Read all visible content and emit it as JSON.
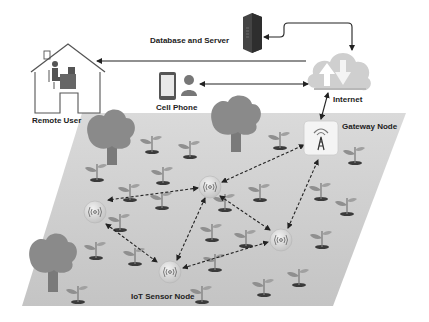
{
  "labels": {
    "database_server": "Database and Server",
    "remote_user": "Remote User",
    "cell_phone": "Cell Phone",
    "internet": "Internet",
    "gateway_node": "Gateway Node",
    "iot_sensor_node": "IoT Sensor Node"
  },
  "colors": {
    "field": "#c9c9c9",
    "field_top": "#d9d9d9",
    "tree": "#8a8a8a",
    "trunk": "#7a7a7a",
    "plant_leaf": "#8f8f8f",
    "soil": "#3a3a3a",
    "cloud": "#cfcfcf",
    "arrow": "#222222",
    "server": "#444444",
    "node_fill": "#dedede"
  },
  "nodes": {
    "sensor_nodes": [
      {
        "id": "s1",
        "x": 95,
        "y": 212
      },
      {
        "id": "s2",
        "x": 210,
        "y": 187
      },
      {
        "id": "s3",
        "x": 170,
        "y": 272
      },
      {
        "id": "s4",
        "x": 281,
        "y": 240
      }
    ],
    "gateway": {
      "x": 320,
      "y": 140
    }
  },
  "links": [
    {
      "from": "s2",
      "to": "s1",
      "style": "dashed",
      "direction": "both"
    },
    {
      "from": "s1",
      "to": "s3",
      "style": "dashed",
      "direction": "both"
    },
    {
      "from": "s2",
      "to": "s3",
      "style": "dashed",
      "direction": "both"
    },
    {
      "from": "s2",
      "to": "s4",
      "style": "dashed",
      "direction": "both"
    },
    {
      "from": "s3",
      "to": "s4",
      "style": "dashed",
      "direction": "both"
    },
    {
      "from": "s2",
      "to": "gateway",
      "style": "dashed",
      "direction": "both"
    },
    {
      "from": "s4",
      "to": "gateway",
      "style": "dashed",
      "direction": "both"
    },
    {
      "from": "gateway",
      "to": "internet",
      "style": "solid",
      "direction": "both"
    },
    {
      "from": "internet",
      "to": "remote_user",
      "style": "solid",
      "direction": "to"
    },
    {
      "from": "internet",
      "to": "cell_phone",
      "style": "solid",
      "direction": "both"
    },
    {
      "from": "internet",
      "to": "database_server",
      "style": "solid",
      "direction": "both"
    }
  ]
}
